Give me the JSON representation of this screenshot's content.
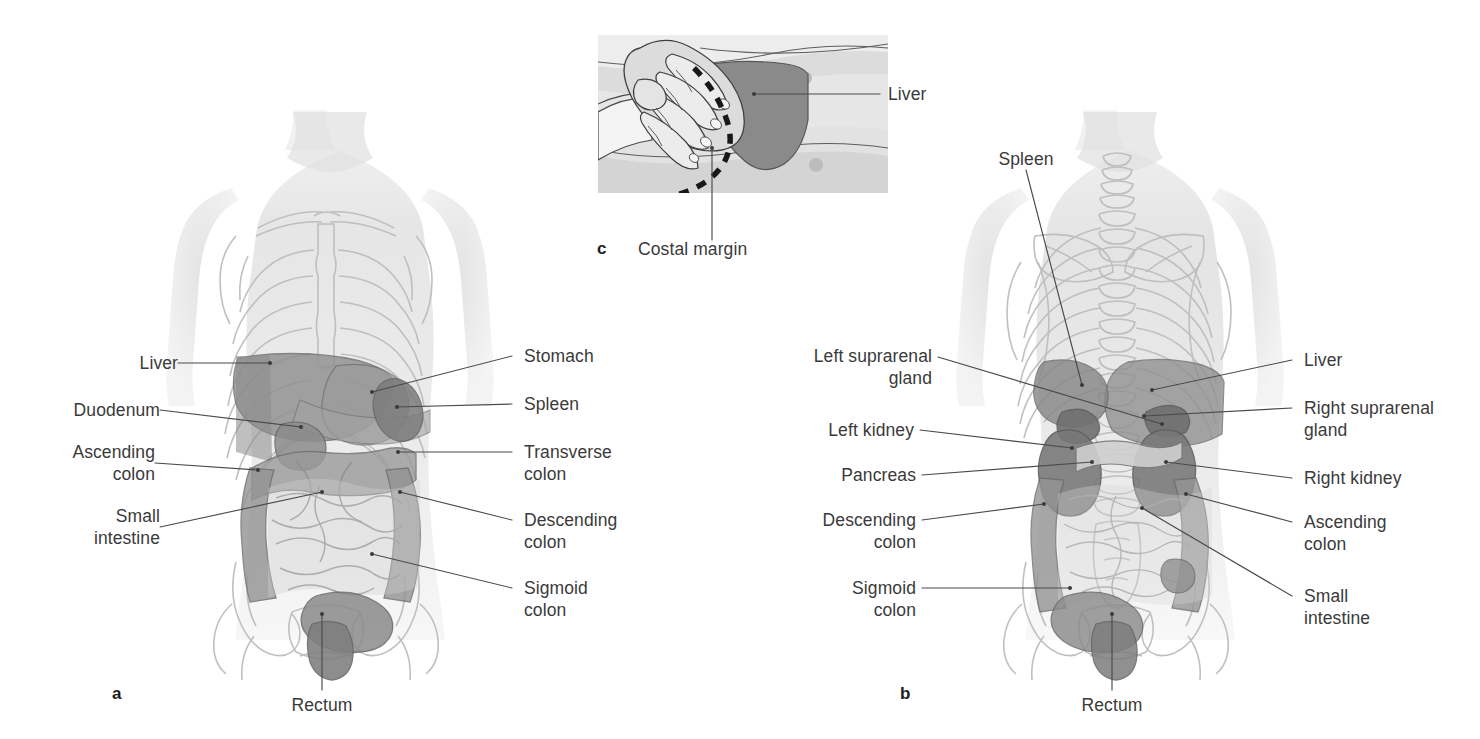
{
  "figure": {
    "panels": [
      {
        "id": "a",
        "letter": "a",
        "view": "anterior",
        "letter_pos": {
          "x": 112,
          "y": 690
        },
        "labels_left": [
          {
            "name": "liver",
            "text": "Liver",
            "x": 96,
            "y": 368,
            "lines": 1
          },
          {
            "name": "duodenum",
            "text": "Duodenum",
            "x": 96,
            "y": 415,
            "lines": 1
          },
          {
            "name": "ascending-colon",
            "text": "Ascending\ncolon",
            "x": 96,
            "y": 455,
            "lines": 2
          },
          {
            "name": "small-intestine",
            "text": "Small\nintestine",
            "x": 96,
            "y": 518,
            "lines": 2
          }
        ],
        "labels_right": [
          {
            "name": "stomach",
            "text": "Stomach",
            "x": 524,
            "y": 348,
            "lines": 1
          },
          {
            "name": "spleen",
            "text": "Spleen",
            "x": 524,
            "y": 396,
            "lines": 1
          },
          {
            "name": "transverse-colon",
            "text": "Transverse\ncolon",
            "x": 524,
            "y": 443,
            "lines": 2
          },
          {
            "name": "descending-colon",
            "text": "Descending\ncolon",
            "x": 524,
            "y": 513,
            "lines": 2
          },
          {
            "name": "sigmoid-colon",
            "text": "Sigmoid\ncolon",
            "x": 524,
            "y": 581,
            "lines": 2
          }
        ],
        "labels_bottom": [
          {
            "name": "rectum",
            "text": "Rectum",
            "x": 285,
            "y": 692,
            "lines": 1
          }
        ]
      },
      {
        "id": "b",
        "letter": "b",
        "view": "posterior",
        "letter_pos": {
          "x": 900,
          "y": 690
        },
        "labels_top": [
          {
            "name": "spleen",
            "text": "Spleen",
            "x": 970,
            "y": 150,
            "lines": 1
          }
        ],
        "labels_left": [
          {
            "name": "left-suprarenal-gland",
            "text": "Left suprarenal\ngland",
            "x": 788,
            "y": 348,
            "lines": 2
          },
          {
            "name": "left-kidney",
            "text": "Left kidney",
            "x": 788,
            "y": 425,
            "lines": 1
          },
          {
            "name": "pancreas",
            "text": "Pancreas",
            "x": 788,
            "y": 470,
            "lines": 1
          },
          {
            "name": "descending-colon",
            "text": "Descending\ncolon",
            "x": 788,
            "y": 513,
            "lines": 2
          },
          {
            "name": "sigmoid-colon",
            "text": "Sigmoid\ncolon",
            "x": 788,
            "y": 581,
            "lines": 2
          }
        ],
        "labels_right": [
          {
            "name": "liver",
            "text": "Liver",
            "x": 1304,
            "y": 352,
            "lines": 1
          },
          {
            "name": "right-suprarenal-gland",
            "text": "Right suprarenal\ngland",
            "x": 1304,
            "y": 400,
            "lines": 2
          },
          {
            "name": "right-kidney",
            "text": "Right kidney",
            "x": 1304,
            "y": 470,
            "lines": 1
          },
          {
            "name": "ascending-colon",
            "text": "Ascending\ncolon",
            "x": 1304,
            "y": 513,
            "lines": 2
          },
          {
            "name": "small-intestine",
            "text": "Small\nintestine",
            "x": 1304,
            "y": 588,
            "lines": 2
          }
        ],
        "labels_bottom": [
          {
            "name": "rectum",
            "text": "Rectum",
            "x": 1065,
            "y": 692,
            "lines": 1
          }
        ]
      },
      {
        "id": "c",
        "letter": "c",
        "view": "liver-palpation",
        "letter_pos": {
          "x": 597,
          "y": 244
        },
        "labels_right": [
          {
            "name": "liver",
            "text": "Liver",
            "x": 890,
            "y": 86,
            "lines": 1
          }
        ],
        "labels_bottom": [
          {
            "name": "costal-margin",
            "text": "Costal margin",
            "x": 640,
            "y": 244,
            "lines": 1
          }
        ]
      }
    ],
    "colors": {
      "body_fill": "#ebebeb",
      "body_edge": "#d9d9d9",
      "bone_line": "#b8b8b8",
      "organ_mid": "#9a9a9a",
      "organ_dark": "#7e7e7e",
      "organ_darker": "#6f6f6f",
      "organ_light": "#c9c9c9",
      "outline": "#6d6d6d",
      "leader_line": "#4a4a4a",
      "text": "#3a3a3a",
      "panel_c_bg": "#e2e2e2",
      "panel_c_liver": "#8a8a8a",
      "dash": "#1d1d1d"
    }
  }
}
